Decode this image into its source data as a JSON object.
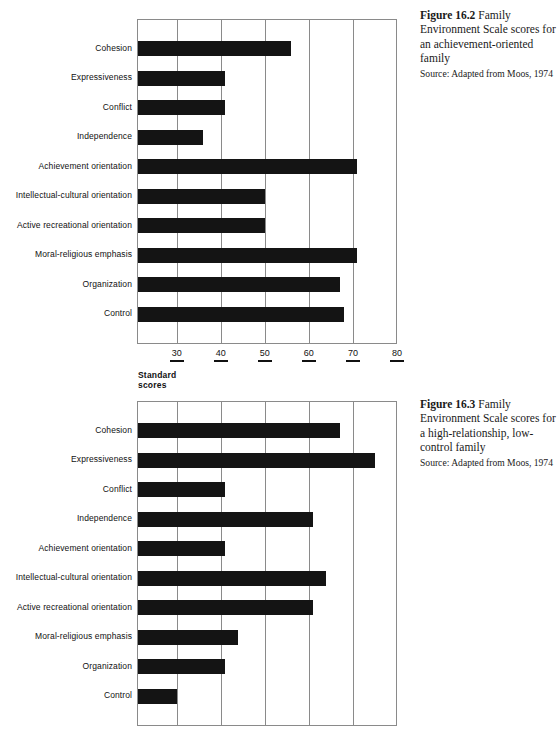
{
  "page": {
    "width": 560,
    "height": 730,
    "background": "#ffffff",
    "bar_color": "#141414",
    "grid_color": "#8a8a8a"
  },
  "figures": [
    {
      "id": "figure-16-2",
      "caption_number": "Figure 16.2",
      "caption_title": "Family Environment Scale scores for an achievement-oriented family",
      "caption_source": "Source: Adapted from Moos, 1974",
      "axis_title": "Standard scores",
      "chart_data": {
        "type": "bar",
        "orientation": "horizontal",
        "title": "Family Environment Scale scores for an achievement-oriented family",
        "xlabel": "Standard scores",
        "ylabel": "",
        "xlim": [
          21,
          80
        ],
        "xticks": [
          30,
          40,
          50,
          60,
          70,
          80
        ],
        "grid": true,
        "legend": "none",
        "categories": [
          "Cohesion",
          "Expressiveness",
          "Conflict",
          "Independence",
          "Achievement orientation",
          "Intellectual-cultural orientation",
          "Active recreational orientation",
          "Moral-religious emphasis",
          "Organization",
          "Control"
        ],
        "values": [
          56,
          41,
          41,
          36,
          71,
          50,
          50,
          71,
          67,
          68
        ]
      }
    },
    {
      "id": "figure-16-3",
      "caption_number": "Figure 16.3",
      "caption_title": "Family Environment Scale scores for a high-relationship, low-control family",
      "caption_source": "Source: Adapted from Moos, 1974",
      "axis_title": "",
      "chart_data": {
        "type": "bar",
        "orientation": "horizontal",
        "title": "Family Environment Scale scores for a high-relationship, low-control family",
        "xlabel": "",
        "ylabel": "",
        "xlim": [
          21,
          80
        ],
        "xticks": [
          30,
          40,
          50,
          60,
          70,
          80
        ],
        "grid": true,
        "legend": "none",
        "categories": [
          "Cohesion",
          "Expressiveness",
          "Conflict",
          "Independence",
          "Achievement orientation",
          "Intellectual-cultural orientation",
          "Active recreational orientation",
          "Moral-religious emphasis",
          "Organization",
          "Control"
        ],
        "values": [
          67,
          75,
          41,
          61,
          41,
          64,
          61,
          44,
          41,
          30
        ]
      }
    }
  ]
}
